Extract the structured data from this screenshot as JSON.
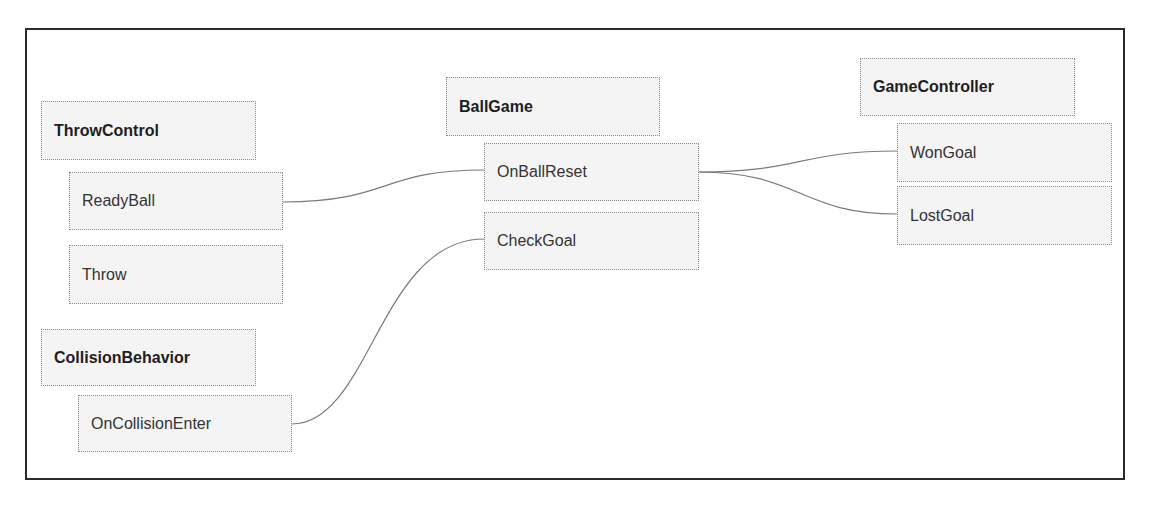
{
  "diagram": {
    "nodes": [
      {
        "id": "throwcontrol",
        "label": "ThrowControl",
        "kind": "class",
        "x": 41,
        "y": 101,
        "w": 215,
        "h": 59
      },
      {
        "id": "readyball",
        "label": "ReadyBall",
        "kind": "method",
        "x": 69,
        "y": 172,
        "w": 214,
        "h": 58
      },
      {
        "id": "throw",
        "label": "Throw",
        "kind": "method",
        "x": 69,
        "y": 245,
        "w": 214,
        "h": 59
      },
      {
        "id": "collisionbehavior",
        "label": "CollisionBehavior",
        "kind": "class",
        "x": 41,
        "y": 329,
        "w": 215,
        "h": 57
      },
      {
        "id": "oncollisionenter",
        "label": "OnCollisionEnter",
        "kind": "method",
        "x": 78,
        "y": 395,
        "w": 214,
        "h": 57
      },
      {
        "id": "ballgame",
        "label": "BallGame",
        "kind": "class",
        "x": 446,
        "y": 77,
        "w": 214,
        "h": 59
      },
      {
        "id": "onballreset",
        "label": "OnBallReset",
        "kind": "method",
        "x": 484,
        "y": 143,
        "w": 215,
        "h": 58
      },
      {
        "id": "checkgoal",
        "label": "CheckGoal",
        "kind": "method",
        "x": 484,
        "y": 212,
        "w": 215,
        "h": 58
      },
      {
        "id": "gamecontroller",
        "label": "GameController",
        "kind": "class",
        "x": 860,
        "y": 58,
        "w": 215,
        "h": 58
      },
      {
        "id": "wongoal",
        "label": "WonGoal",
        "kind": "method",
        "x": 897,
        "y": 123,
        "w": 215,
        "h": 59
      },
      {
        "id": "lostgoal",
        "label": "LostGoal",
        "kind": "method",
        "x": 897,
        "y": 186,
        "w": 215,
        "h": 59
      }
    ],
    "edges": [
      {
        "from": "ReadyBall",
        "to": "OnBallReset",
        "d": "M283,202 C390,202 380,170 484,170"
      },
      {
        "from": "OnCollisionEnter",
        "to": "CheckGoal",
        "d": "M292,424 C370,424 380,239 484,239"
      },
      {
        "from": "OnBallReset",
        "to": "WonGoal",
        "d": "M699,172 C800,172 800,151 897,151"
      },
      {
        "from": "OnBallReset",
        "to": "LostGoal",
        "d": "M699,172 C800,172 800,214 897,214"
      }
    ]
  }
}
